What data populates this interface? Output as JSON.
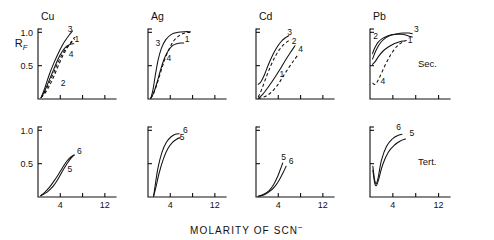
{
  "figure": {
    "xlabel": "MOLARITY OF SCN",
    "xlabel_sup": "−",
    "ylabel_main": "R",
    "ylabel_sub": "F",
    "row_labels": {
      "top": "Sec.",
      "bottom": "Tert."
    },
    "x_ticks": [
      "4",
      "12"
    ],
    "y_ticks": [
      "0.5",
      "1.0"
    ],
    "panel_titles": [
      "Cu",
      "Ag",
      "Cd",
      "Pb"
    ]
  },
  "chart_data": {
    "type": "line",
    "title": "",
    "xlabel": "MOLARITY OF SCN−",
    "ylabel": "RF",
    "xlim": [
      0,
      14
    ],
    "ylim": [
      0,
      1.05
    ],
    "x_ticks": [
      4,
      12
    ],
    "y_ticks": [
      0.5,
      1.0
    ],
    "grid": false,
    "legend": "inline curve numbers",
    "panels": [
      {
        "row": "Sec.",
        "metal": "Cu",
        "series": [
          {
            "name": "1",
            "style": "solid",
            "label_x": 6.55,
            "label_y": 0.86,
            "x": [
              0.55,
              1.2,
              2.0,
              2.8,
              3.6,
              4.4,
              5.1,
              5.8,
              6.4
            ],
            "y": [
              0.02,
              0.12,
              0.28,
              0.44,
              0.6,
              0.72,
              0.79,
              0.82,
              0.83
            ]
          },
          {
            "name": "2",
            "style": "dashed",
            "label_x": 4.1,
            "label_y": 0.2,
            "x": [
              0.55,
              1.2,
              2.0,
              2.8,
              3.6,
              4.4,
              5.2,
              6.0,
              6.6
            ],
            "y": [
              0.02,
              0.08,
              0.19,
              0.33,
              0.49,
              0.64,
              0.76,
              0.86,
              0.93
            ]
          },
          {
            "name": "3",
            "style": "solid",
            "label_x": 5.35,
            "label_y": 1.0,
            "x": [
              0.55,
              1.2,
              2.0,
              2.8,
              3.6,
              4.4,
              5.0,
              5.6,
              6.2
            ],
            "y": [
              0.02,
              0.16,
              0.36,
              0.53,
              0.68,
              0.81,
              0.89,
              0.96,
              1.02
            ]
          },
          {
            "name": "4",
            "style": "dashed",
            "label_x": 5.5,
            "label_y": 0.63,
            "x": [
              0.55,
              1.2,
              2.0,
              2.8,
              3.6,
              4.4,
              5.2,
              6.0,
              6.6
            ],
            "y": [
              0.02,
              0.1,
              0.24,
              0.39,
              0.55,
              0.68,
              0.78,
              0.85,
              0.9
            ]
          }
        ]
      },
      {
        "row": "Sec.",
        "metal": "Ag",
        "series": [
          {
            "name": "1",
            "style": "solid",
            "label_x": 6.6,
            "label_y": 0.86,
            "x": [
              0.5,
              1.0,
              1.6,
              2.2,
              2.9,
              3.6,
              4.4,
              5.2,
              6.0,
              6.4
            ],
            "y": [
              0.01,
              0.09,
              0.24,
              0.42,
              0.6,
              0.72,
              0.8,
              0.83,
              0.84,
              0.84
            ]
          },
          {
            "name": "3",
            "style": "solid",
            "label_x": 1.35,
            "label_y": 0.8,
            "x": [
              0.5,
              0.9,
              1.3,
              1.8,
              2.4,
              3.2,
              4.2,
              5.4,
              6.6,
              7.6
            ],
            "y": [
              0.01,
              0.14,
              0.35,
              0.58,
              0.76,
              0.89,
              0.97,
              1.0,
              1.01,
              1.01
            ]
          },
          {
            "name": "4",
            "style": "dashed",
            "label_x": 3.3,
            "label_y": 0.57,
            "x": [
              0.5,
              1.0,
              1.6,
              2.3,
              3.0,
              3.8,
              4.6,
              5.6,
              6.6,
              7.6
            ],
            "y": [
              0.01,
              0.08,
              0.22,
              0.41,
              0.59,
              0.75,
              0.87,
              0.95,
              0.99,
              1.0
            ]
          }
        ]
      },
      {
        "row": "Sec.",
        "metal": "Cd",
        "series": [
          {
            "name": "1",
            "style": "solid",
            "label_x": 4.2,
            "label_y": 0.33,
            "x": [
              0.4,
              1.2,
              2.2,
              3.2,
              4.2,
              5.2,
              6.2,
              7.0
            ],
            "y": [
              0.01,
              0.07,
              0.18,
              0.3,
              0.43,
              0.57,
              0.7,
              0.8
            ]
          },
          {
            "name": "2",
            "style": "dashed",
            "label_x": 6.4,
            "label_y": 0.82,
            "x": [
              0.4,
              1.0,
              1.8,
              2.6,
              3.4,
              4.2,
              5.0,
              5.8,
              6.3
            ],
            "y": [
              0.03,
              0.14,
              0.32,
              0.49,
              0.63,
              0.74,
              0.82,
              0.87,
              0.89
            ]
          },
          {
            "name": "3",
            "style": "solid",
            "label_x": 5.6,
            "label_y": 0.96,
            "x": [
              0.4,
              0.9,
              1.5,
              2.2,
              3.0,
              3.8,
              4.6,
              5.3,
              5.9
            ],
            "y": [
              0.22,
              0.26,
              0.36,
              0.51,
              0.66,
              0.78,
              0.87,
              0.92,
              0.95
            ]
          },
          {
            "name": "4",
            "style": "dashed",
            "label_x": 7.6,
            "label_y": 0.7,
            "x": [
              0.4,
              1.4,
              2.6,
              3.8,
              4.8,
              5.8,
              6.8,
              7.6
            ],
            "y": [
              0.01,
              0.03,
              0.09,
              0.2,
              0.33,
              0.46,
              0.58,
              0.67
            ]
          }
        ]
      },
      {
        "row": "Sec.",
        "metal": "Pb",
        "series": [
          {
            "name": "1",
            "style": "solid",
            "label_x": 6.6,
            "label_y": 0.84,
            "x": [
              0.45,
              0.9,
              1.5,
              2.3,
              3.2,
              4.2,
              5.2,
              6.0
            ],
            "y": [
              0.52,
              0.56,
              0.64,
              0.72,
              0.78,
              0.83,
              0.86,
              0.87
            ]
          },
          {
            "name": "2",
            "style": "solid",
            "label_x": 0.55,
            "label_y": 0.9,
            "x": [
              0.45,
              0.8,
              1.4,
              2.2,
              3.2,
              4.4,
              5.6,
              6.6,
              7.4
            ],
            "y": [
              0.68,
              0.76,
              0.85,
              0.91,
              0.95,
              0.97,
              0.97,
              0.95,
              0.93
            ]
          },
          {
            "name": "3",
            "style": "solid",
            "label_x": 7.7,
            "label_y": 1.0,
            "x": [
              0.45,
              1.0,
              1.8,
              2.8,
              3.8,
              4.8,
              5.8,
              6.8,
              7.4
            ],
            "y": [
              0.6,
              0.72,
              0.84,
              0.92,
              0.96,
              0.98,
              0.99,
              0.99,
              0.98
            ]
          },
          {
            "name": "4",
            "style": "dashed",
            "label_x": 1.85,
            "label_y": 0.22,
            "x": [
              0.45,
              0.9,
              1.6,
              2.6,
              3.6,
              4.6,
              5.6,
              6.4
            ],
            "y": [
              0.24,
              0.22,
              0.31,
              0.5,
              0.66,
              0.78,
              0.85,
              0.88
            ]
          }
        ]
      },
      {
        "row": "Tert.",
        "metal": "Cu",
        "series": [
          {
            "name": "5",
            "style": "solid",
            "label_x": 5.3,
            "label_y": 0.38,
            "x": [
              0.5,
              1.2,
              2.0,
              2.8,
              3.6,
              4.4,
              5.2,
              5.9,
              6.5
            ],
            "y": [
              0.02,
              0.05,
              0.1,
              0.17,
              0.27,
              0.39,
              0.5,
              0.58,
              0.63
            ]
          },
          {
            "name": "6",
            "style": "solid",
            "label_x": 7.0,
            "label_y": 0.64,
            "x": [
              0.5,
              1.2,
              2.0,
              2.8,
              3.6,
              4.4,
              5.2,
              5.9,
              6.5
            ],
            "y": [
              0.02,
              0.07,
              0.14,
              0.23,
              0.33,
              0.44,
              0.54,
              0.6,
              0.63
            ]
          }
        ]
      },
      {
        "row": "Tert.",
        "metal": "Ag",
        "series": [
          {
            "name": "5",
            "style": "solid",
            "label_x": 5.7,
            "label_y": 0.85,
            "x": [
              1.0,
              1.4,
              2.0,
              2.8,
              3.6,
              4.4,
              5.2,
              5.8
            ],
            "y": [
              0.01,
              0.14,
              0.36,
              0.58,
              0.73,
              0.82,
              0.87,
              0.89
            ]
          },
          {
            "name": "6",
            "style": "solid",
            "label_x": 6.3,
            "label_y": 0.96,
            "x": [
              1.0,
              1.3,
              1.8,
              2.5,
              3.3,
              4.1,
              4.9,
              5.6
            ],
            "y": [
              0.01,
              0.18,
              0.44,
              0.67,
              0.82,
              0.9,
              0.94,
              0.95
            ]
          }
        ]
      },
      {
        "row": "Tert.",
        "metal": "Cd",
        "series": [
          {
            "name": "5",
            "style": "solid",
            "label_x": 4.55,
            "label_y": 0.56,
            "x": [
              0.4,
              1.4,
              2.4,
              3.2,
              3.9,
              4.4,
              4.8
            ],
            "y": [
              0.01,
              0.04,
              0.1,
              0.19,
              0.31,
              0.42,
              0.51
            ]
          },
          {
            "name": "6",
            "style": "solid",
            "label_x": 5.9,
            "label_y": 0.5,
            "x": [
              0.4,
              1.4,
              2.4,
              3.4,
              4.2,
              4.9,
              5.4
            ],
            "y": [
              0.01,
              0.03,
              0.08,
              0.16,
              0.26,
              0.37,
              0.46
            ]
          }
        ]
      },
      {
        "row": "Tert.",
        "metal": "Pb",
        "series": [
          {
            "name": "5",
            "style": "solid",
            "label_x": 6.9,
            "label_y": 0.91,
            "x": [
              0.5,
              0.8,
              1.1,
              1.5,
              2.2,
              3.2,
              4.3,
              5.3,
              6.2
            ],
            "y": [
              0.4,
              0.22,
              0.17,
              0.26,
              0.48,
              0.67,
              0.78,
              0.84,
              0.87
            ]
          },
          {
            "name": "6",
            "style": "solid",
            "label_x": 4.6,
            "label_y": 1.0,
            "x": [
              0.5,
              0.8,
              1.1,
              1.45,
              2.0,
              2.9,
              3.9,
              4.8,
              5.6
            ],
            "y": [
              0.46,
              0.26,
              0.2,
              0.3,
              0.55,
              0.76,
              0.87,
              0.92,
              0.94
            ]
          }
        ]
      }
    ]
  }
}
